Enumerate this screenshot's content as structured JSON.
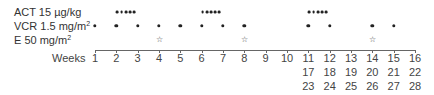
{
  "rows": [
    {
      "id": "act",
      "label": "ACT 15 µg/kg",
      "label_main": "ACT 15 µg/kg",
      "label_sup": "",
      "marker": "dot-cluster",
      "weeks": [
        2,
        6,
        11
      ]
    },
    {
      "id": "vcr",
      "label": "VCR 1.5 mg/m²",
      "label_main": "VCR 1.5 mg/m",
      "label_sup": "2",
      "marker": "dot",
      "weeks": [
        1,
        2,
        3,
        4,
        5,
        6,
        7,
        8,
        11,
        12,
        14,
        15
      ]
    },
    {
      "id": "e",
      "label": "E 50 mg/m²",
      "label_main": "E 50 mg/m",
      "label_sup": "2",
      "marker": "star",
      "weeks": [
        4,
        8,
        14
      ]
    }
  ],
  "axis": {
    "label": "Weeks",
    "ticks": [
      "1",
      "2",
      "3",
      "4",
      "5",
      "6",
      "7",
      "8",
      "9",
      "10",
      "11",
      "12",
      "13",
      "14",
      "15",
      "16"
    ],
    "second_row": {
      "start_tick": 11,
      "labels": [
        "17",
        "18",
        "19",
        "20",
        "21",
        "22"
      ]
    },
    "third_row": {
      "start_tick": 11,
      "labels": [
        "23",
        "24",
        "25",
        "26",
        "27",
        "28"
      ]
    }
  },
  "icons": {
    "dot": "filled-circle",
    "cluster": "five-dot-cluster",
    "star": "open-star ☆"
  },
  "star_glyph": "☆",
  "colors": {
    "marker": "#222222",
    "axis": "#666666",
    "text": "#3a3a3a"
  }
}
